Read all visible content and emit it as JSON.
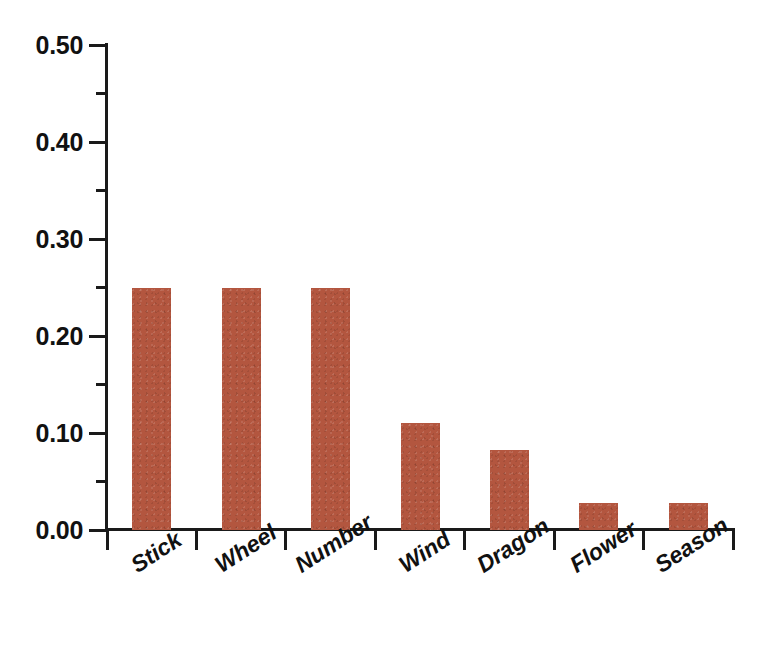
{
  "chart_data": {
    "type": "bar",
    "title": "",
    "subtitle": "",
    "xlabel": "",
    "ylabel": "",
    "categories": [
      "Stick",
      "Wheel",
      "Number",
      "Wind",
      "Dragon",
      "Flower",
      "Season"
    ],
    "values": [
      0.25,
      0.25,
      0.25,
      0.11,
      0.083,
      0.028,
      0.028
    ],
    "ylim": [
      0.0,
      0.5
    ],
    "ytick_values": [
      0.0,
      0.05,
      0.1,
      0.15,
      0.2,
      0.25,
      0.3,
      0.35,
      0.4,
      0.45,
      0.5
    ],
    "ytick_labels": [
      "0.00",
      "",
      "0.10",
      "",
      "0.20",
      "",
      "0.30",
      "",
      "0.40",
      "",
      "0.50"
    ],
    "ytick_major": [
      0.0,
      0.1,
      0.2,
      0.3,
      0.4,
      0.5
    ],
    "ytick_minor": [
      0.05,
      0.15,
      0.25,
      0.35,
      0.45
    ],
    "grid": false,
    "legend": null,
    "legend_position": "none",
    "bar_color": "#b3563f",
    "axis_color": "#1a1a1a",
    "background_color": "#ffffff",
    "annotations": []
  },
  "axis": {
    "y_labels": [
      "0.00",
      "0.10",
      "0.20",
      "0.30",
      "0.40",
      "0.50"
    ],
    "x_labels": [
      "Stick",
      "Wheel",
      "Number",
      "Wind",
      "Dragon",
      "Flower",
      "Season"
    ]
  }
}
